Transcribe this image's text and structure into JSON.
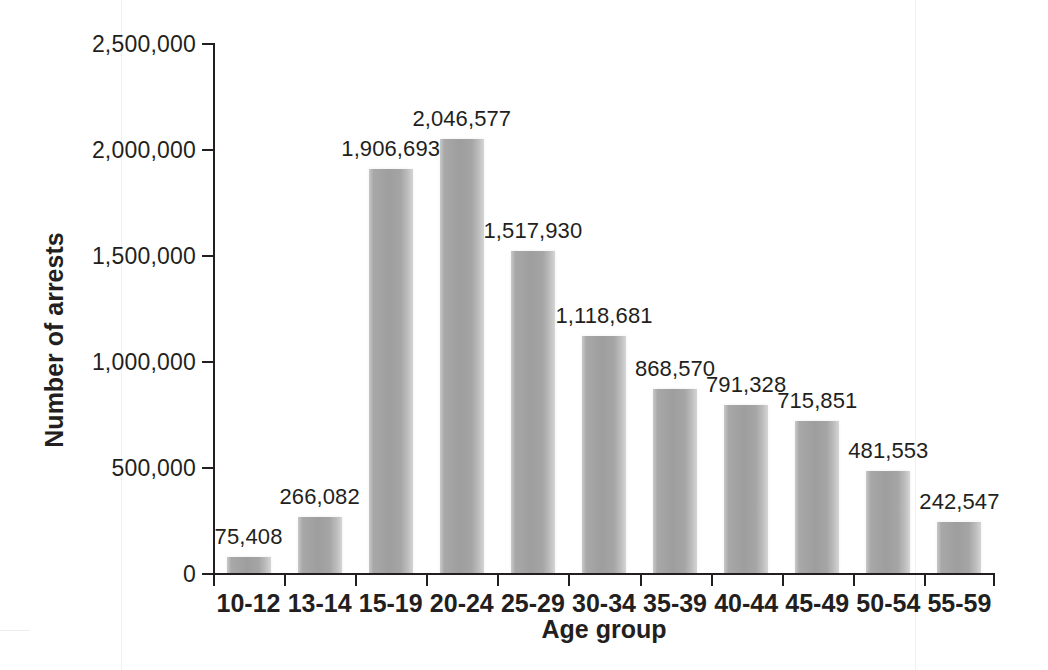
{
  "chart_data": {
    "type": "bar",
    "title": "",
    "xlabel": "Age group",
    "ylabel": "Number of arrests",
    "categories": [
      "10-12",
      "13-14",
      "15-19",
      "20-24",
      "25-29",
      "30-34",
      "35-39",
      "40-44",
      "45-49",
      "50-54",
      "55-59"
    ],
    "values": [
      75408,
      266082,
      1906693,
      2046577,
      1517930,
      1118681,
      868570,
      791328,
      715851,
      481553,
      242547
    ],
    "value_labels": [
      "75,408",
      "266,082",
      "1,906,693",
      "2,046,577",
      "1,517,930",
      "1,118,681",
      "868,570",
      "791,328",
      "715,851",
      "481,553",
      "242,547"
    ],
    "ylim": [
      0,
      2500000
    ],
    "ytick_values": [
      0,
      500000,
      1000000,
      1500000,
      2000000,
      2500000
    ],
    "ytick_labels": [
      "0",
      "500,000",
      "1,000,000",
      "1,500,000",
      "2,000,000",
      "2,500,000"
    ],
    "grid": false,
    "legend": null,
    "bar_color": "#a3a3a3",
    "axis_color": "#231f20",
    "background": "#ffffff"
  }
}
